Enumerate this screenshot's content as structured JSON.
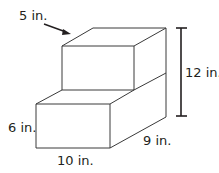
{
  "diagram": {
    "type": "step-shaped rectangular prism figure",
    "labels": {
      "top_depth": "5 in.",
      "total_height": "12 in.",
      "bottom_height": "6 in.",
      "bottom_width": "10 in.",
      "depth": "9 in."
    },
    "colors": {
      "line": "#3a3a3a",
      "text": "#231f20",
      "background": "#ffffff"
    }
  }
}
